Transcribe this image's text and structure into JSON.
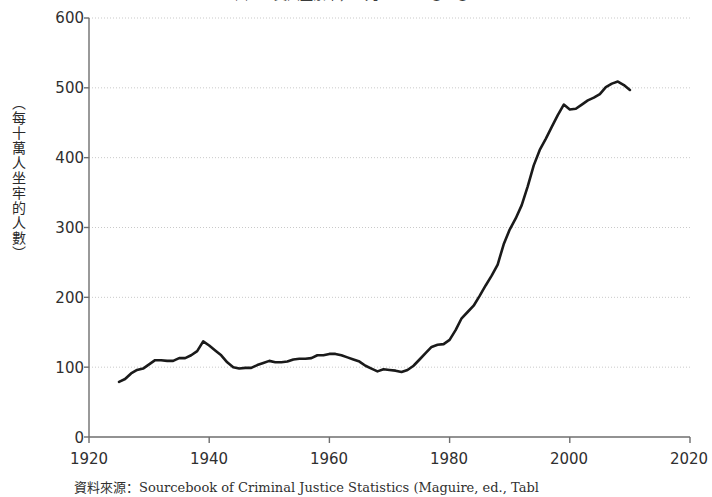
{
  "figure": {
    "title": "圖一　美國監禁率，一九二五～二〇一〇",
    "source_note": "資料來源：Sourcebook of Criminal Justice Statistics (Maguire, ed., Tabl"
  },
  "chart_data": {
    "type": "line",
    "title": "圖一　美國監禁率，一九二五～二〇一〇",
    "xlabel": "",
    "ylabel": "（每十萬人坐牢的人數）",
    "xlim": [
      1920,
      2020
    ],
    "ylim": [
      0,
      600
    ],
    "xticks": [
      1920,
      1940,
      1960,
      1980,
      2000,
      2020
    ],
    "yticks": [
      0,
      100,
      200,
      300,
      400,
      500,
      600
    ],
    "grid": "horizontal-dotted",
    "legend": "none",
    "line_color": "#1a1a1a",
    "grid_color": "#c9c9c9",
    "axis_color": "#6e6e6e",
    "series": [
      {
        "name": "美國監禁率（每十萬人）",
        "x": [
          1925,
          1926,
          1927,
          1928,
          1929,
          1930,
          1931,
          1932,
          1933,
          1934,
          1935,
          1936,
          1937,
          1938,
          1939,
          1940,
          1941,
          1942,
          1943,
          1944,
          1945,
          1946,
          1947,
          1948,
          1949,
          1950,
          1951,
          1952,
          1953,
          1954,
          1955,
          1956,
          1957,
          1958,
          1959,
          1960,
          1961,
          1962,
          1963,
          1964,
          1965,
          1966,
          1967,
          1968,
          1969,
          1970,
          1971,
          1972,
          1973,
          1974,
          1975,
          1976,
          1977,
          1978,
          1979,
          1980,
          1981,
          1982,
          1983,
          1984,
          1985,
          1986,
          1987,
          1988,
          1989,
          1990,
          1991,
          1992,
          1993,
          1994,
          1995,
          1996,
          1997,
          1998,
          1999,
          2000,
          2001,
          2002,
          2003,
          2004,
          2005,
          2006,
          2007,
          2008,
          2009,
          2010
        ],
        "y": [
          79,
          83,
          91,
          96,
          98,
          104,
          110,
          110,
          109,
          109,
          113,
          113,
          117,
          123,
          137,
          131,
          124,
          117,
          107,
          100,
          98,
          99,
          99,
          103,
          106,
          109,
          107,
          107,
          108,
          111,
          112,
          112,
          113,
          117,
          117,
          119,
          119,
          117,
          114,
          111,
          108,
          102,
          98,
          94,
          97,
          96,
          95,
          93,
          96,
          102,
          111,
          120,
          129,
          132,
          133,
          139,
          153,
          170,
          179,
          188,
          202,
          217,
          231,
          247,
          276,
          297,
          313,
          332,
          359,
          389,
          411,
          427,
          444,
          461,
          476,
          469,
          470,
          476,
          482,
          486,
          491,
          501,
          506,
          509,
          504,
          497
        ],
        "units": "每十萬人坐牢的人數"
      }
    ],
    "annotations": []
  },
  "axes": {
    "y_tick_labels": [
      "600",
      "500",
      "400",
      "300",
      "200",
      "100",
      "0"
    ],
    "x_tick_labels": [
      "1920",
      "1940",
      "1960",
      "1980",
      "2000",
      "2020"
    ]
  }
}
